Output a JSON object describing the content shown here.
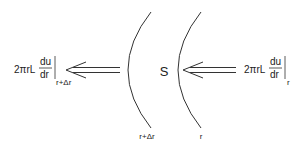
{
  "diagram": {
    "region_label": "S",
    "inner_surface_label": "r",
    "outer_surface_label": "r+Δr",
    "left_flux": {
      "prefix": "2πrL",
      "numerator": "du",
      "denominator": "dr",
      "evaluated_at": "r+Δr"
    },
    "right_flux": {
      "prefix": "2πrL",
      "numerator": "du",
      "denominator": "dr",
      "evaluated_at": "r"
    },
    "colors": {
      "stroke": "#333333",
      "text": "#222222"
    }
  }
}
